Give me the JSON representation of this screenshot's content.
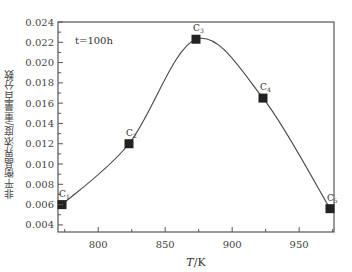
{
  "chart_data": {
    "type": "line",
    "title": "",
    "annotation": "t=100h",
    "xlabel": "T/K",
    "ylabel": "非平衡晶界浓度/重量百分数",
    "xlim": [
      770,
      976
    ],
    "ylim": [
      0.0033,
      0.024
    ],
    "xticks": [
      800,
      850,
      900,
      950
    ],
    "yticks": [
      0.004,
      0.006,
      0.008,
      0.01,
      0.012,
      0.014,
      0.016,
      0.018,
      0.02,
      0.022,
      0.024
    ],
    "ytick_labels": [
      "0.004",
      "0.006",
      "0.008",
      "0.010",
      "0.012",
      "0.014",
      "0.016",
      "0.018",
      "0.020",
      "0.022",
      "0.024"
    ],
    "grid": false,
    "legend": null,
    "series": [
      {
        "name": "t=100h",
        "marker": "square",
        "smooth": true,
        "points": [
          {
            "label": "C1",
            "x": 773,
            "y": 0.006
          },
          {
            "label": "C2",
            "x": 823,
            "y": 0.012
          },
          {
            "label": "C3",
            "x": 873,
            "y": 0.0223
          },
          {
            "label": "C4",
            "x": 923,
            "y": 0.0165
          },
          {
            "label": "C5",
            "x": 973,
            "y": 0.0056
          }
        ]
      }
    ]
  }
}
